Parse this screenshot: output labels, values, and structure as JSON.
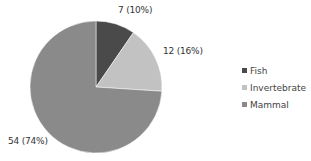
{
  "chart_data": {
    "type": "pie",
    "title": "",
    "categories": [
      "Fish",
      "Invertebrate",
      "Mammal"
    ],
    "values": [
      7,
      12,
      54
    ],
    "percentages": [
      10,
      16,
      74
    ],
    "data_labels": [
      "7 (10%)",
      "12 (16%)",
      "54 (74%)"
    ],
    "colors": [
      "#4a4a4a",
      "#c2c2c2",
      "#8a8a8a"
    ],
    "legend_position": "right",
    "start_angle_deg": 0,
    "direction": "clockwise"
  },
  "legend": {
    "items": [
      {
        "label": "Fish",
        "color": "#4a4a4a"
      },
      {
        "label": "Invertebrate",
        "color": "#c2c2c2"
      },
      {
        "label": "Mammal",
        "color": "#8a8a8a"
      }
    ]
  }
}
